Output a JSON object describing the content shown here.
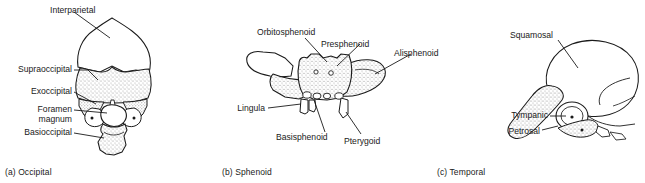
{
  "figure": {
    "background_color": "#ffffff",
    "ink_color": "#1a1a1a",
    "stipple_color": "#9a9a9a"
  },
  "panels": [
    {
      "id": "occipital",
      "caption": "(a) Occipital",
      "labels": [
        {
          "name": "interparietal",
          "text": "Interparietal"
        },
        {
          "name": "supraoccipital",
          "text": "Supraoccipital"
        },
        {
          "name": "exoccipital",
          "text": "Exoccipital"
        },
        {
          "name": "foramen",
          "text": "Foramen"
        },
        {
          "name": "magnum",
          "text": "magnum"
        },
        {
          "name": "basioccipital",
          "text": "Basioccipital"
        }
      ]
    },
    {
      "id": "sphenoid",
      "caption": "(b) Sphenoid",
      "labels": [
        {
          "name": "orbitosphenoid",
          "text": "Orbitosphenoid"
        },
        {
          "name": "presphenoid",
          "text": "Presphenoid"
        },
        {
          "name": "alisphenoid",
          "text": "Alisphenoid"
        },
        {
          "name": "lingula",
          "text": "Lingula"
        },
        {
          "name": "basisphenoid",
          "text": "Basisphenoid"
        },
        {
          "name": "pterygoid",
          "text": "Pterygoid"
        }
      ]
    },
    {
      "id": "temporal",
      "caption": "(c) Temporal",
      "labels": [
        {
          "name": "squamosal",
          "text": "Squamosal"
        },
        {
          "name": "tympanic",
          "text": "Tympanic"
        },
        {
          "name": "petrosal",
          "text": "Petrosal"
        }
      ]
    }
  ]
}
